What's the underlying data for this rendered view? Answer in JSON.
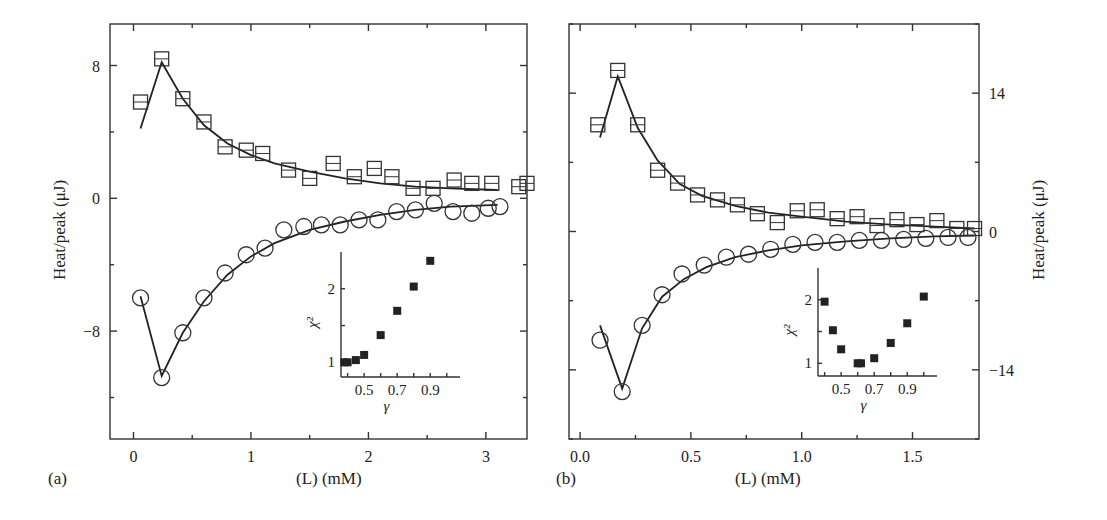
{
  "chart_data": [
    {
      "panel": "(a)",
      "type": "scatter",
      "xlabel": "(L) (mM)",
      "ylabel": "Heat/peak (μJ)",
      "xlim": [
        -0.2,
        3.35
      ],
      "ylim": [
        -14.5,
        10.5
      ],
      "xticks": [
        0,
        1,
        2,
        3
      ],
      "yticks": [
        8,
        0,
        -8
      ],
      "series": [
        {
          "name": "squares",
          "marker": "square",
          "x": [
            0.06,
            0.24,
            0.42,
            0.6,
            0.78,
            0.96,
            1.1,
            1.32,
            1.5,
            1.7,
            1.88,
            2.05,
            2.2,
            2.38,
            2.55,
            2.73,
            2.88,
            3.05,
            3.28,
            3.35
          ],
          "y": [
            5.8,
            8.4,
            6.0,
            4.6,
            3.1,
            2.9,
            2.7,
            1.7,
            1.2,
            2.1,
            1.3,
            1.8,
            1.3,
            0.6,
            0.6,
            1.1,
            0.9,
            0.9,
            0.7,
            0.9
          ]
        },
        {
          "name": "circles",
          "marker": "circle",
          "x": [
            0.06,
            0.24,
            0.42,
            0.6,
            0.78,
            0.96,
            1.12,
            1.28,
            1.45,
            1.6,
            1.76,
            1.92,
            2.08,
            2.24,
            2.4,
            2.56,
            2.72,
            2.88,
            3.02,
            3.12
          ],
          "y": [
            -6.0,
            -10.8,
            -8.1,
            -6.0,
            -4.5,
            -3.4,
            -3.0,
            -1.9,
            -1.7,
            -1.6,
            -1.6,
            -1.3,
            -1.3,
            -0.8,
            -0.7,
            -0.3,
            -0.8,
            -0.9,
            -0.6,
            -0.5
          ]
        }
      ],
      "fits": {
        "squares": {
          "x": [
            0.06,
            0.24,
            0.42,
            0.6,
            0.8,
            1.0,
            1.2,
            1.5,
            1.8,
            2.1,
            2.4,
            2.7,
            3.1
          ],
          "y": [
            4.2,
            8.2,
            6.0,
            4.4,
            3.3,
            2.6,
            2.1,
            1.6,
            1.2,
            0.9,
            0.7,
            0.6,
            0.5
          ]
        },
        "circles": {
          "x": [
            0.06,
            0.24,
            0.42,
            0.6,
            0.8,
            1.0,
            1.2,
            1.5,
            1.8,
            2.1,
            2.4,
            2.7,
            3.1
          ],
          "y": [
            -5.9,
            -10.7,
            -8.1,
            -6.2,
            -4.6,
            -3.5,
            -2.7,
            -1.9,
            -1.4,
            -1.0,
            -0.7,
            -0.5,
            -0.4
          ]
        }
      },
      "inset": {
        "xlabel": "γ",
        "ylabel": "χ²",
        "xticks": [
          0.5,
          0.7,
          0.9
        ],
        "yticks": [
          1,
          2
        ],
        "x": [
          0.38,
          0.4,
          0.45,
          0.5,
          0.6,
          0.7,
          0.8,
          0.9
        ],
        "y": [
          1.0,
          1.0,
          1.03,
          1.1,
          1.37,
          1.7,
          2.03,
          2.38
        ]
      }
    },
    {
      "panel": "(b)",
      "type": "scatter",
      "xlabel": "(L) (mM)",
      "ylabel": "Heat/peak (μJ)",
      "xlim": [
        -0.05,
        1.8
      ],
      "ylim": [
        -21,
        21
      ],
      "xticks": [
        0.0,
        0.5,
        1.0,
        1.5
      ],
      "yticks": [
        14,
        0,
        -14
      ],
      "series": [
        {
          "name": "squares",
          "marker": "square",
          "x": [
            0.08,
            0.17,
            0.26,
            0.35,
            0.44,
            0.53,
            0.62,
            0.71,
            0.8,
            0.89,
            0.98,
            1.07,
            1.16,
            1.25,
            1.34,
            1.43,
            1.52,
            1.61,
            1.7,
            1.78
          ],
          "y": [
            10.8,
            16.3,
            10.8,
            6.2,
            4.9,
            3.7,
            3.2,
            2.7,
            1.8,
            0.9,
            2.1,
            2.2,
            1.3,
            1.5,
            0.6,
            1.2,
            0.7,
            1.1,
            0.3,
            0.3
          ]
        },
        {
          "name": "circles",
          "marker": "circle",
          "x": [
            0.09,
            0.19,
            0.28,
            0.37,
            0.46,
            0.56,
            0.66,
            0.76,
            0.86,
            0.96,
            1.06,
            1.16,
            1.26,
            1.36,
            1.46,
            1.56,
            1.66,
            1.75
          ],
          "y": [
            -11.0,
            -16.2,
            -9.5,
            -6.4,
            -4.3,
            -3.4,
            -2.6,
            -2.3,
            -1.8,
            -1.3,
            -1.1,
            -1.1,
            -0.9,
            -0.9,
            -0.8,
            -0.7,
            -0.6,
            -0.6
          ]
        }
      ],
      "fits": {
        "squares": {
          "x": [
            0.09,
            0.17,
            0.26,
            0.35,
            0.45,
            0.55,
            0.7,
            0.85,
            1.0,
            1.2,
            1.4,
            1.6,
            1.78
          ],
          "y": [
            9.5,
            15.7,
            10.5,
            7.2,
            4.8,
            3.6,
            2.6,
            1.9,
            1.5,
            1.0,
            0.7,
            0.5,
            0.3
          ]
        },
        "circles": {
          "x": [
            0.09,
            0.19,
            0.28,
            0.37,
            0.47,
            0.57,
            0.7,
            0.85,
            1.0,
            1.2,
            1.4,
            1.6,
            1.78
          ],
          "y": [
            -9.5,
            -15.9,
            -9.8,
            -6.6,
            -4.8,
            -3.6,
            -2.6,
            -1.9,
            -1.4,
            -1.0,
            -0.7,
            -0.5,
            -0.4
          ]
        }
      },
      "inset": {
        "xlabel": "γ",
        "ylabel": "χ²",
        "xticks": [
          0.5,
          0.7,
          0.9
        ],
        "yticks": [
          1,
          2
        ],
        "x": [
          0.4,
          0.45,
          0.5,
          0.6,
          0.62,
          0.7,
          0.8,
          0.9,
          1.0
        ],
        "y": [
          1.97,
          1.52,
          1.22,
          1.0,
          1.0,
          1.08,
          1.32,
          1.63,
          2.05
        ]
      }
    }
  ],
  "labels": {
    "panel_a": "(a)",
    "panel_b": "(b)",
    "xlabel_a": "(L) (mM)",
    "xlabel_b": "(L) (mM)",
    "ylabel_a": "Heat/peak (μJ)",
    "ylabel_b": "Heat/peak (μJ)"
  }
}
